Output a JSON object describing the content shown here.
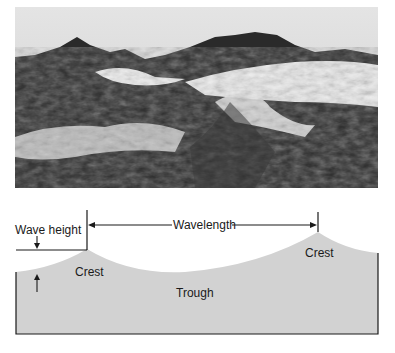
{
  "photo": {
    "subject": "rough ocean waves photograph",
    "tone": "black-and-white"
  },
  "diagram": {
    "labels": {
      "wave_height": "Wave height",
      "wavelength": "Wavelength",
      "crest_left": "Crest",
      "crest_right": "Crest",
      "trough": "Trough"
    },
    "colors": {
      "water_fill": "#d2d2d2",
      "line": "#1a1a1a",
      "background": "#ffffff"
    }
  }
}
